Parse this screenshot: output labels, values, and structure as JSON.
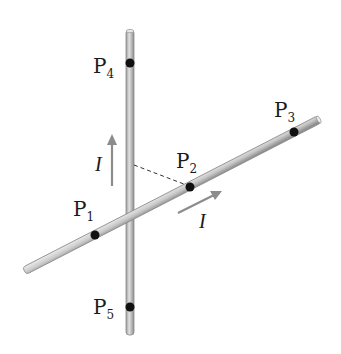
{
  "figure": {
    "colors": {
      "rod_fill": "#c8c8c8",
      "rod_edge": "#8a8a8a",
      "dot": "#111111",
      "arrow": "#8c8c8c",
      "text": "#1a1a1a"
    },
    "points": [
      {
        "name": "P",
        "sub": "1"
      },
      {
        "name": "P",
        "sub": "2"
      },
      {
        "name": "P",
        "sub": "3"
      },
      {
        "name": "P",
        "sub": "4"
      },
      {
        "name": "P",
        "sub": "5"
      }
    ],
    "currents": [
      {
        "label": "I",
        "direction": "up (vertical rod)"
      },
      {
        "label": "I",
        "direction": "along diagonal rod toward upper right"
      }
    ]
  }
}
